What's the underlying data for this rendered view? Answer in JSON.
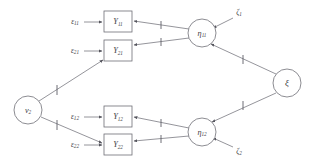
{
  "diagram": {
    "type": "path-diagram",
    "colors": {
      "stroke": "#7a7a82",
      "node_stroke": "#6e6e76",
      "label": "#3b3b42",
      "background": "#ffffff"
    },
    "exogenous_circle": {
      "name": "nu-2",
      "symbol": "ν",
      "subscript": "2",
      "cx": 28,
      "cy": 110,
      "r": 14
    },
    "latent_circles": [
      {
        "name": "eta-11",
        "symbol": "η",
        "subscript": "11",
        "cx": 202,
        "cy": 33,
        "r": 14
      },
      {
        "name": "eta-12",
        "symbol": "η",
        "subscript": "12",
        "cx": 202,
        "cy": 132,
        "r": 14
      },
      {
        "name": "xi",
        "symbol": "ξ",
        "subscript": "",
        "cx": 287,
        "cy": 83,
        "r": 14
      }
    ],
    "indicator_boxes": [
      {
        "name": "Y-11",
        "symbol": "Y",
        "subscript": "11",
        "x": 104,
        "y": 11,
        "w": 28,
        "h": 21
      },
      {
        "name": "Y-21",
        "symbol": "Y",
        "subscript": "21",
        "x": 104,
        "y": 40,
        "w": 28,
        "h": 21
      },
      {
        "name": "Y-12",
        "symbol": "Y",
        "subscript": "12",
        "x": 104,
        "y": 106,
        "w": 28,
        "h": 21
      },
      {
        "name": "Y-22",
        "symbol": "Y",
        "subscript": "22",
        "x": 104,
        "y": 134,
        "w": 28,
        "h": 21
      }
    ],
    "error_labels": [
      {
        "name": "epsilon-11",
        "symbol": "ε",
        "subscript": "11",
        "x": 72,
        "y": 22
      },
      {
        "name": "epsilon-21",
        "symbol": "ε",
        "subscript": "21",
        "x": 72,
        "y": 51
      },
      {
        "name": "epsilon-12",
        "symbol": "ε",
        "subscript": "12",
        "x": 72,
        "y": 117
      },
      {
        "name": "epsilon-22",
        "symbol": "ε",
        "subscript": "22",
        "x": 72,
        "y": 145
      }
    ],
    "disturbance_labels": [
      {
        "name": "zeta-1",
        "symbol": "ζ",
        "subscript": "1",
        "x": 238,
        "y": 13
      },
      {
        "name": "zeta-2",
        "symbol": "ζ",
        "subscript": "2",
        "x": 238,
        "y": 152
      }
    ],
    "paths": [
      {
        "name": "path-epsilon11-to-Y11",
        "from": "epsilon-11",
        "to": "Y-11",
        "ticks": 0
      },
      {
        "name": "path-epsilon21-to-Y21",
        "from": "epsilon-21",
        "to": "Y-21",
        "ticks": 0
      },
      {
        "name": "path-epsilon12-to-Y12",
        "from": "epsilon-12",
        "to": "Y-12",
        "ticks": 0
      },
      {
        "name": "path-epsilon22-to-Y22",
        "from": "epsilon-22",
        "to": "Y-22",
        "ticks": 0
      },
      {
        "name": "path-eta11-to-Y11",
        "from": "eta-11",
        "to": "Y-11",
        "ticks": 1
      },
      {
        "name": "path-eta11-to-Y21",
        "from": "eta-11",
        "to": "Y-21",
        "ticks": 1
      },
      {
        "name": "path-eta12-to-Y12",
        "from": "eta-12",
        "to": "Y-12",
        "ticks": 1
      },
      {
        "name": "path-eta12-to-Y22",
        "from": "eta-12",
        "to": "Y-22",
        "ticks": 1
      },
      {
        "name": "path-nu2-to-Y21",
        "from": "nu-2",
        "to": "Y-21",
        "ticks": 1
      },
      {
        "name": "path-nu2-to-Y22",
        "from": "nu-2",
        "to": "Y-22",
        "ticks": 1
      },
      {
        "name": "path-xi-to-eta11",
        "from": "xi",
        "to": "eta-11",
        "ticks": 1
      },
      {
        "name": "path-xi-to-eta12",
        "from": "xi",
        "to": "eta-12",
        "ticks": 1
      },
      {
        "name": "path-zeta1-to-eta11",
        "from": "zeta-1",
        "to": "eta-11",
        "ticks": 0
      },
      {
        "name": "path-zeta2-to-eta12",
        "from": "zeta-2",
        "to": "eta-12",
        "ticks": 0
      }
    ]
  }
}
